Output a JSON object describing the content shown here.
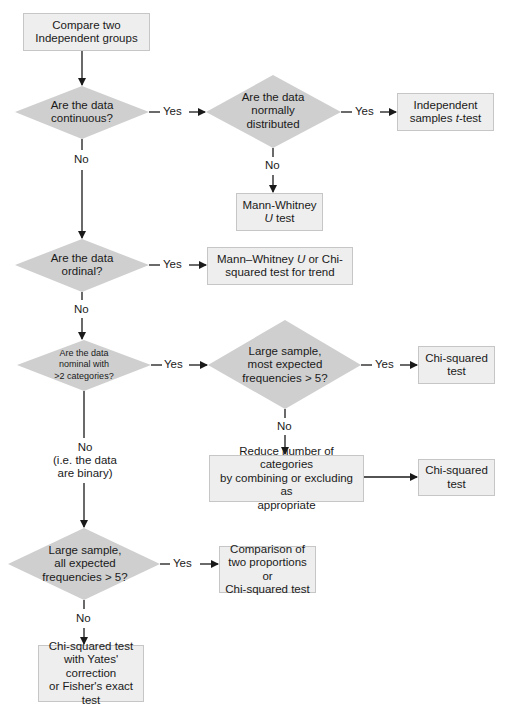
{
  "flowchart": {
    "start": {
      "lines": [
        "Compare two",
        "Independent groups"
      ]
    },
    "decisions": {
      "continuous": {
        "lines": [
          "Are the data",
          "continuous?"
        ]
      },
      "normal": {
        "lines": [
          "Are the data",
          "normally",
          "distributed"
        ]
      },
      "ordinal": {
        "lines": [
          "Are the data",
          "ordinal?"
        ]
      },
      "nominal": {
        "lines": [
          "Are the data",
          "nominal with",
          ">2 categories?"
        ]
      },
      "large_most": {
        "lines": [
          "Large sample,",
          "most expected",
          "frequencies > 5?"
        ]
      },
      "large_all": {
        "lines": [
          "Large sample,",
          "all expected",
          "frequencies > 5?"
        ]
      }
    },
    "outcomes": {
      "t_test": {
        "lines": [
          "Independent",
          "samples t-test"
        ],
        "italic_word": "t"
      },
      "mann_whitney": {
        "lines": [
          "Mann-Whitney",
          "U test"
        ],
        "italic_word": "U"
      },
      "ordinal_result": {
        "lines": [
          "Mann–Whitney U or Chi-",
          "squared test for trend"
        ],
        "italic_word": "U"
      },
      "chi_squared_1": {
        "lines": [
          "Chi-squared",
          "test"
        ]
      },
      "reduce": {
        "lines": [
          "Reduce number of categories",
          "by combining or excluding as",
          "appropriate"
        ]
      },
      "chi_squared_2": {
        "lines": [
          "Chi-squared",
          "test"
        ]
      },
      "comparison": {
        "lines": [
          "Comparison of",
          "two proportions or",
          "Chi-squared test"
        ]
      },
      "yates": {
        "lines": [
          "Chi-squared test",
          "with Yates'",
          "correction",
          "or Fisher's exact test"
        ]
      }
    },
    "edge_labels": {
      "yes": "Yes",
      "no": "No",
      "binary_note": [
        "No",
        "(i.e. the data",
        "are binary)"
      ]
    },
    "colors": {
      "box_fill": "#eeeeee",
      "box_border": "#c6c6c6",
      "diamond_fill": "#cfcfcf",
      "line": "#1a1a1a"
    }
  }
}
